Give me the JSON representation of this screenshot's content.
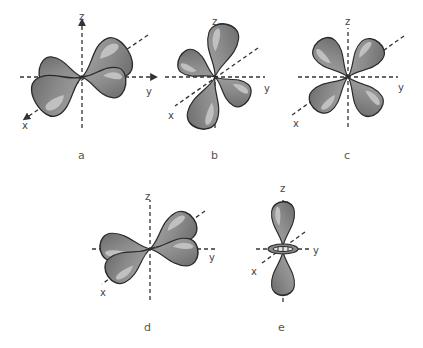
{
  "figure": {
    "panels": [
      {
        "id": "a",
        "label": "a",
        "axes": {
          "x": "x",
          "y": "y",
          "z": "z"
        },
        "description": "four lobes in the xy plane between axes (dxy)"
      },
      {
        "id": "b",
        "label": "b",
        "axes": {
          "x": "x",
          "y": "y",
          "z": "z"
        },
        "description": "four lobes in the xz plane between axes (dxz)"
      },
      {
        "id": "c",
        "label": "c",
        "axes": {
          "x": "x",
          "y": "y",
          "z": "z"
        },
        "description": "four lobes in the yz plane between axes (dyz)"
      },
      {
        "id": "d",
        "label": "d",
        "axes": {
          "x": "x",
          "y": "y",
          "z": "z"
        },
        "description": "four lobes along the x and y axes (dx2-y2)"
      },
      {
        "id": "e",
        "label": "e",
        "axes": {
          "x": "x",
          "y": "y",
          "z": "z"
        },
        "description": "two lobes along z with a torus in the xy plane (dz2)"
      }
    ]
  },
  "colors": {
    "lobe_dark": "#7a7a7a",
    "lobe_light": "#bdbdbd",
    "outline": "#2a2a2a",
    "axis": "#333333",
    "label_text": "#555555"
  }
}
